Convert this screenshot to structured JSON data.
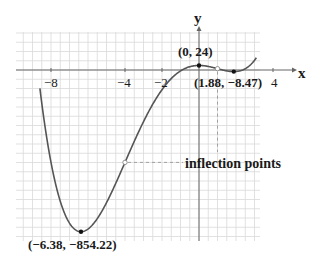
{
  "chart_data": {
    "type": "line",
    "title": "",
    "xlabel": "x",
    "ylabel": "y",
    "function": "x^4 + 6x^3 - 24x^2 + 24",
    "xlim": [
      -10,
      5
    ],
    "ylim": [
      -920,
      120
    ],
    "grid": true,
    "x_ticks": [
      {
        "value": -8,
        "label": "−8"
      },
      {
        "value": -4,
        "label": "−4"
      },
      {
        "value": -2,
        "label": "−2"
      },
      {
        "value": 4,
        "label": "4"
      }
    ],
    "series": [
      {
        "name": "f(x)",
        "x_range": [
          -8.6,
          3.1
        ],
        "color": "#555555"
      }
    ],
    "points": [
      {
        "x": 0,
        "y": 24,
        "label": "(0, 24)",
        "kind": "local-max"
      },
      {
        "x": 1.88,
        "y": -8.47,
        "label": "(1.88, −8.47)",
        "kind": "local-min"
      },
      {
        "x": -6.38,
        "y": -854.22,
        "label": "(−6.38, −854.22)",
        "kind": "global-min"
      }
    ],
    "inflection_points": [
      {
        "x": -4,
        "y": -488
      },
      {
        "x": 1,
        "y": 7
      }
    ],
    "annotations": [
      {
        "text": "inflection points",
        "points_to": "inflection_points"
      }
    ]
  }
}
